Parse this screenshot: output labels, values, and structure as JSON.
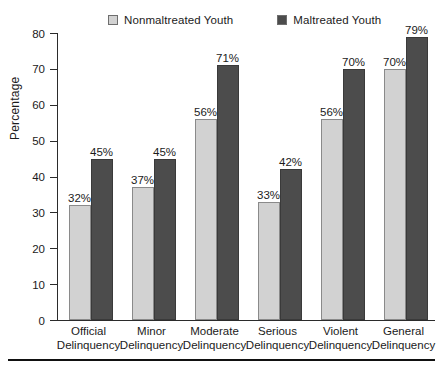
{
  "chart_data": {
    "type": "bar",
    "title": "",
    "xlabel": "",
    "ylabel": "Percentage",
    "ylim": [
      0,
      80
    ],
    "yticks": [
      0,
      10,
      20,
      30,
      40,
      50,
      60,
      70,
      80
    ],
    "ytick_labels": [
      "0",
      "10",
      "20",
      "30",
      "40",
      "50",
      "60",
      "70",
      "80"
    ],
    "grid": false,
    "legend_position": "top",
    "value_suffix": "%",
    "categories": [
      "Official Delinquency",
      "Minor Delinquency",
      "Moderate Delinquency",
      "Serious Delinquency",
      "Violent Delinquency",
      "General Delinquency"
    ],
    "category_lines": [
      {
        "line1": "Official",
        "line2": "Delinquency"
      },
      {
        "line1": "Minor",
        "line2": "Delinquency"
      },
      {
        "line1": "Moderate",
        "line2": "Delinquency"
      },
      {
        "line1": "Serious",
        "line2": "Delinquency"
      },
      {
        "line1": "Violent",
        "line2": "Delinquency"
      },
      {
        "line1": "General",
        "line2": "Delinquency"
      }
    ],
    "series": [
      {
        "name": "Nonmaltreated Youth",
        "color": "#d2d2d2",
        "values": [
          32,
          37,
          56,
          33,
          56,
          70
        ],
        "labels": [
          "32%",
          "37%",
          "56%",
          "33%",
          "56%",
          "70%"
        ]
      },
      {
        "name": "Maltreated Youth",
        "color": "#4c4c4c",
        "values": [
          45,
          45,
          71,
          42,
          70,
          79
        ],
        "labels": [
          "45%",
          "45%",
          "71%",
          "42%",
          "70%",
          "79%"
        ]
      }
    ]
  },
  "legend": {
    "entries": [
      {
        "label": "Nonmaltreated Youth",
        "color": "#d2d2d2"
      },
      {
        "label": "Maltreated Youth",
        "color": "#4c4c4c"
      }
    ]
  },
  "colors": {
    "nonmaltreated": "#d2d2d2",
    "maltreated": "#4c4c4c",
    "axis": "#2b2b2b",
    "text": "#1b1b1b",
    "rule": "#111111"
  }
}
